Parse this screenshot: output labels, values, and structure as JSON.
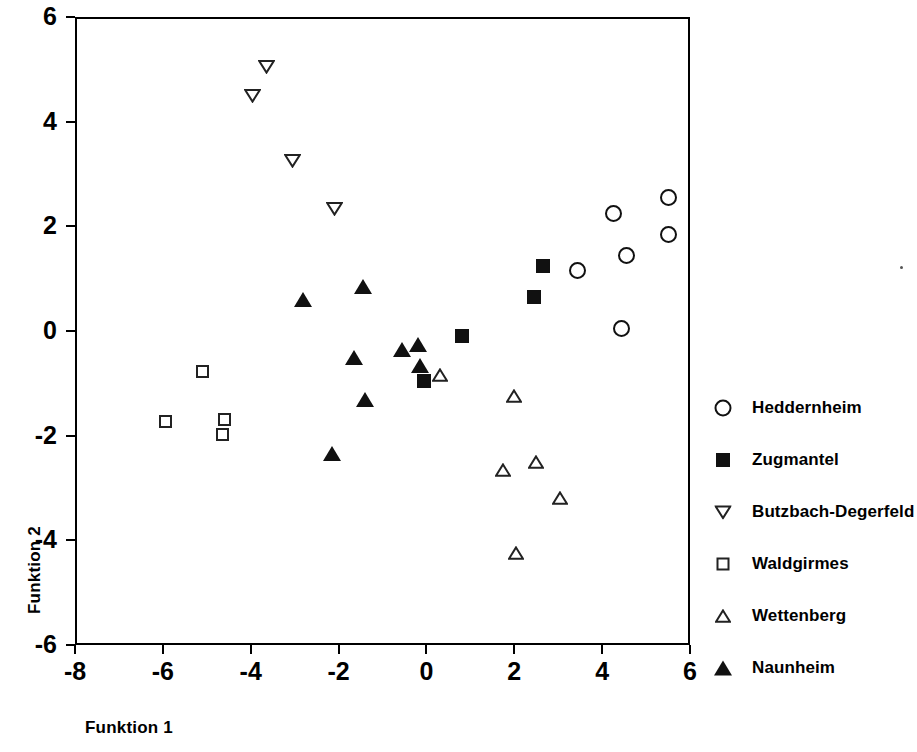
{
  "chart_data": {
    "type": "scatter",
    "title": "",
    "xlabel": "Funktion 1",
    "ylabel": "Funktion 2",
    "xlim": [
      -8,
      6
    ],
    "ylim": [
      -6,
      6
    ],
    "xticks": [
      -8,
      -6,
      -4,
      -2,
      0,
      2,
      4,
      6
    ],
    "yticks": [
      -6,
      -4,
      -2,
      0,
      2,
      4,
      6
    ],
    "xtick_labels": [
      "-8",
      "-6",
      "-4",
      "-2",
      "0",
      "2",
      "4",
      "6"
    ],
    "ytick_labels": [
      "-6",
      "-4",
      "-2",
      "0",
      "2",
      "4",
      "6"
    ],
    "grid": false,
    "legend_position": "right",
    "marker_color": "#111111",
    "series": [
      {
        "name": "Heddernheim",
        "marker": "circle-open",
        "points": [
          [
            3.45,
            1.15
          ],
          [
            4.25,
            2.25
          ],
          [
            4.55,
            1.45
          ],
          [
            5.5,
            2.55
          ],
          [
            5.5,
            1.85
          ],
          [
            4.45,
            0.05
          ]
        ]
      },
      {
        "name": "Zugmantel",
        "marker": "square-filled",
        "points": [
          [
            2.65,
            1.25
          ],
          [
            2.45,
            0.65
          ],
          [
            0.8,
            -0.1
          ],
          [
            -0.05,
            -0.95
          ]
        ]
      },
      {
        "name": "Butzbach-Degerfeld",
        "marker": "triangle-down-open",
        "points": [
          [
            -3.65,
            5.05
          ],
          [
            -3.95,
            4.5
          ],
          [
            -3.05,
            3.25
          ],
          [
            -2.1,
            2.35
          ]
        ]
      },
      {
        "name": "Waldgirmes",
        "marker": "square-open",
        "points": [
          [
            -5.1,
            -0.77
          ],
          [
            -5.95,
            -1.72
          ],
          [
            -4.6,
            -1.7
          ],
          [
            -4.65,
            -1.97
          ]
        ]
      },
      {
        "name": "Wettenberg",
        "marker": "triangle-up-open",
        "points": [
          [
            0.3,
            -0.85
          ],
          [
            2.0,
            -1.25
          ],
          [
            1.75,
            -2.65
          ],
          [
            2.5,
            -2.5
          ],
          [
            3.05,
            -3.2
          ],
          [
            2.05,
            -4.25
          ]
        ]
      },
      {
        "name": "Naunheim",
        "marker": "triangle-up-filled",
        "points": [
          [
            -2.8,
            0.6
          ],
          [
            -1.45,
            0.85
          ],
          [
            -1.65,
            -0.5
          ],
          [
            -1.4,
            -1.3
          ],
          [
            -2.15,
            -2.35
          ],
          [
            -0.55,
            -0.35
          ],
          [
            -0.2,
            -0.25
          ],
          [
            -0.15,
            -0.65
          ]
        ]
      }
    ]
  },
  "legend": {
    "entries": [
      {
        "label": "Heddernheim",
        "marker": "circle-open"
      },
      {
        "label": "Zugmantel",
        "marker": "square-filled"
      },
      {
        "label": "Butzbach-Degerfeld",
        "marker": "triangle-down-open"
      },
      {
        "label": "Waldgirmes",
        "marker": "square-open"
      },
      {
        "label": "Wettenberg",
        "marker": "triangle-up-open"
      },
      {
        "label": "Naunheim",
        "marker": "triangle-up-filled"
      }
    ]
  }
}
